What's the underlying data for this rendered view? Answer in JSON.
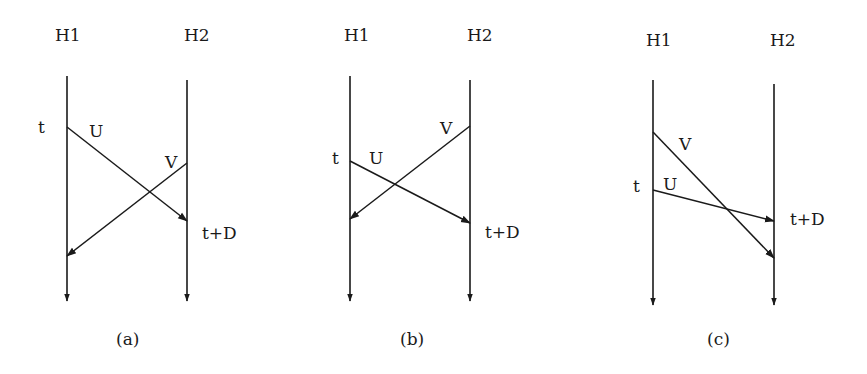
{
  "figure": {
    "panels": [
      {
        "id": "a",
        "caption": "(a)",
        "hosts": {
          "left": "H1",
          "right": "H2"
        },
        "time_label": "t",
        "deadline_label": "t+D",
        "messages": [
          {
            "name": "U",
            "from": "H1",
            "to": "H2",
            "note": "sent at t, arrives at t+D"
          },
          {
            "name": "V",
            "from": "H2",
            "to": "H1",
            "note": "sent after t, arrives after t+D"
          }
        ]
      },
      {
        "id": "b",
        "caption": "(b)",
        "hosts": {
          "left": "H1",
          "right": "H2"
        },
        "time_label": "t",
        "deadline_label": "t+D",
        "messages": [
          {
            "name": "V",
            "from": "H2",
            "to": "H1",
            "note": "sent before t, arrives before t+D"
          },
          {
            "name": "U",
            "from": "H1",
            "to": "H2",
            "note": "sent at t, arrives at t+D"
          }
        ]
      },
      {
        "id": "c",
        "caption": "(c)",
        "hosts": {
          "left": "H1",
          "right": "H2"
        },
        "time_label": "t",
        "deadline_label": "t+D",
        "messages": [
          {
            "name": "V",
            "from": "H1",
            "to": "H2",
            "note": "sent before t, arrives after t+D"
          },
          {
            "name": "U",
            "from": "H1",
            "to": "H2",
            "note": "sent at t, arrives at t+D"
          }
        ]
      }
    ]
  },
  "labels": {
    "a": {
      "h1": "H1",
      "h2": "H2",
      "t": "t",
      "u": "U",
      "v": "V",
      "td": "t+D",
      "caption": "(a)"
    },
    "b": {
      "h1": "H1",
      "h2": "H2",
      "t": "t",
      "u": "U",
      "v": "V",
      "td": "t+D",
      "caption": "(b)"
    },
    "c": {
      "h1": "H1",
      "h2": "H2",
      "t": "t",
      "u": "U",
      "v": "V",
      "td": "t+D",
      "caption": "(c)"
    }
  },
  "colors": {
    "ink": "#1a1a1a",
    "background": "#ffffff"
  }
}
